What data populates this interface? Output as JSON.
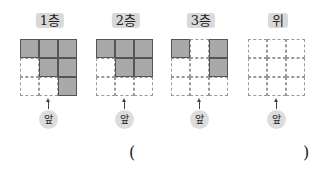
{
  "panels": [
    {
      "label": "1층",
      "front_label": "앞",
      "cells": [
        1,
        1,
        1,
        0,
        1,
        1,
        0,
        0,
        1
      ]
    },
    {
      "label": "2층",
      "front_label": "앞",
      "cells": [
        1,
        1,
        1,
        0,
        1,
        1,
        0,
        0,
        0
      ]
    },
    {
      "label": "3층",
      "front_label": "앞",
      "cells": [
        1,
        0,
        1,
        0,
        0,
        1,
        0,
        0,
        0
      ]
    },
    {
      "label": "위",
      "front_label": "앞",
      "cells": [
        0,
        0,
        0,
        0,
        0,
        0,
        0,
        0,
        0
      ]
    }
  ],
  "answer": {
    "open_paren": "(",
    "close_paren": ")"
  },
  "colors": {
    "filled": "#a9a9a9",
    "badge": "#d9d9d9"
  }
}
